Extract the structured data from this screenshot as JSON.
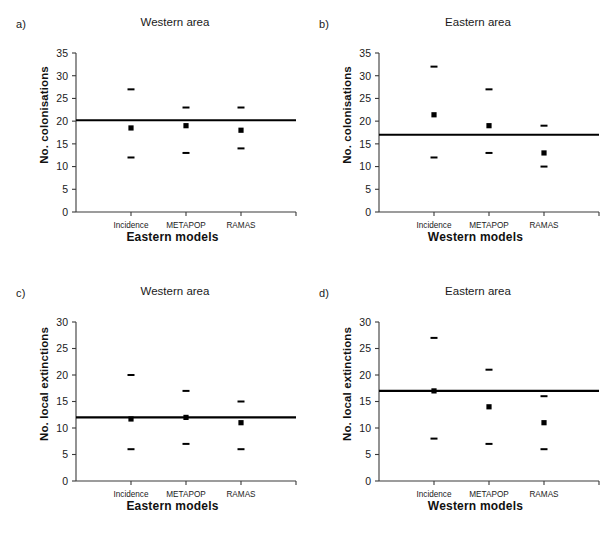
{
  "figure": {
    "background": "#ffffff",
    "width": 607,
    "height": 539,
    "accent_color": "#000000",
    "axis_color": "#3a3a3a"
  },
  "panels": [
    {
      "letter": "a)",
      "title": "Western area",
      "ylabel": "No. colonisations",
      "xlabel": "Eastern models"
    },
    {
      "letter": "b)",
      "title": "Eastern area",
      "ylabel": "No. colonisations",
      "xlabel": "Western models"
    },
    {
      "letter": "c)",
      "title": "Western area",
      "ylabel": "No. local extinctions",
      "xlabel": "Eastern models"
    },
    {
      "letter": "d)",
      "title": "Eastern area",
      "ylabel": "No. local extinctions",
      "xlabel": "Western models"
    }
  ],
  "chart_data": [
    {
      "panel": "a)",
      "type": "scatter",
      "title": "Western area",
      "xlabel": "Eastern models",
      "ylabel": "No. colonisations",
      "categories": [
        "Incidence",
        "METAPOP",
        "RAMAS"
      ],
      "ylim": [
        0,
        35
      ],
      "yticks": [
        0,
        5,
        10,
        15,
        20,
        25,
        30,
        35
      ],
      "grid": false,
      "legend": "none",
      "reference_line": {
        "label": "observed",
        "value": 20.2
      },
      "series": [
        {
          "name": "upper",
          "values": [
            27,
            23,
            23
          ]
        },
        {
          "name": "mean",
          "values": [
            18.5,
            19,
            18
          ]
        },
        {
          "name": "lower",
          "values": [
            12,
            13,
            14
          ]
        }
      ]
    },
    {
      "panel": "b)",
      "type": "scatter",
      "title": "Eastern area",
      "xlabel": "Western models",
      "ylabel": "No. colonisations",
      "categories": [
        "Incidence",
        "METAPOP",
        "RAMAS"
      ],
      "ylim": [
        0,
        35
      ],
      "yticks": [
        0,
        5,
        10,
        15,
        20,
        25,
        30,
        35
      ],
      "grid": false,
      "legend": "none",
      "reference_line": {
        "label": "observed",
        "value": 17
      },
      "series": [
        {
          "name": "upper",
          "values": [
            32,
            27,
            19
          ]
        },
        {
          "name": "mean",
          "values": [
            21.4,
            19,
            13
          ]
        },
        {
          "name": "lower",
          "values": [
            12,
            13,
            10
          ]
        }
      ]
    },
    {
      "panel": "c)",
      "type": "scatter",
      "title": "Western area",
      "xlabel": "Eastern models",
      "ylabel": "No. local extinctions",
      "categories": [
        "Incidence",
        "METAPOP",
        "RAMAS"
      ],
      "ylim": [
        0,
        30
      ],
      "yticks": [
        0,
        5,
        10,
        15,
        20,
        25,
        30
      ],
      "grid": false,
      "legend": "none",
      "reference_line": {
        "label": "observed",
        "value": 12
      },
      "series": [
        {
          "name": "upper",
          "values": [
            20,
            17,
            15
          ]
        },
        {
          "name": "mean",
          "values": [
            11.7,
            12,
            11
          ]
        },
        {
          "name": "lower",
          "values": [
            6,
            7,
            6
          ]
        }
      ]
    },
    {
      "panel": "d)",
      "type": "scatter",
      "title": "Eastern area",
      "xlabel": "Western models",
      "ylabel": "No. local extinctions",
      "categories": [
        "Incidence",
        "METAPOP",
        "RAMAS"
      ],
      "ylim": [
        0,
        30
      ],
      "yticks": [
        0,
        5,
        10,
        15,
        20,
        25,
        30
      ],
      "grid": false,
      "legend": "none",
      "reference_line": {
        "label": "observed",
        "value": 17
      },
      "series": [
        {
          "name": "upper",
          "values": [
            27,
            21,
            16
          ]
        },
        {
          "name": "mean",
          "values": [
            17,
            14,
            11
          ]
        },
        {
          "name": "lower",
          "values": [
            8,
            7,
            6
          ]
        }
      ]
    }
  ]
}
